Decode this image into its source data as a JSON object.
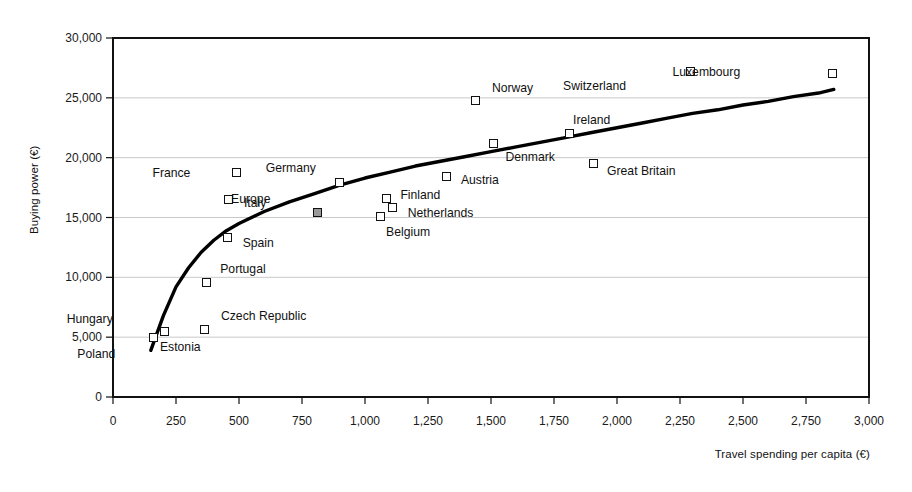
{
  "chart_data": {
    "type": "scatter",
    "title": "",
    "xlabel": "Travel spending per capita (€)",
    "ylabel": "Buying power (€)",
    "xlim": [
      0,
      3000
    ],
    "ylim": [
      0,
      30000
    ],
    "xticks": [
      "0",
      "250",
      "500",
      "750",
      "1,000",
      "1,250",
      "1,500",
      "1,750",
      "2,000",
      "2,250",
      "2,500",
      "2,750",
      "3,000"
    ],
    "xtick_values": [
      0,
      250,
      500,
      750,
      1000,
      1250,
      1500,
      1750,
      2000,
      2250,
      2500,
      2750,
      3000
    ],
    "yticks": [
      "0",
      "5,000",
      "10,000",
      "15,000",
      "20,000",
      "25,000",
      "30,000"
    ],
    "ytick_values": [
      0,
      5000,
      10000,
      15000,
      20000,
      25000,
      30000
    ],
    "grid": "horizontal",
    "legend": "none",
    "points": [
      {
        "label": "Poland",
        "x": 160,
        "y": 5000,
        "label_dx": -44,
        "label_dy": 17,
        "highlight": false
      },
      {
        "label": "Hungary",
        "x": 205,
        "y": 5500,
        "label_dx": -58,
        "label_dy": -12,
        "highlight": false
      },
      {
        "label": "Estonia",
        "x": 365,
        "y": 5600,
        "label_dx": -10,
        "label_dy": 17,
        "highlight": false
      },
      {
        "label": "Czech Republic",
        "x": 365,
        "y": 5600,
        "label_dx": 16,
        "label_dy": -14,
        "highlight": false
      },
      {
        "label": "Portugal",
        "x": 370,
        "y": 9600,
        "label_dx": 14,
        "label_dy": -13,
        "highlight": false
      },
      {
        "label": "Spain",
        "x": 455,
        "y": 13300,
        "label_dx": 15,
        "label_dy": 5,
        "highlight": false
      },
      {
        "label": "Italy",
        "x": 460,
        "y": 16500,
        "label_dx": 15,
        "label_dy": 3,
        "highlight": false
      },
      {
        "label": "France",
        "x": 490,
        "y": 18800,
        "label_dx": -52,
        "label_dy": 1,
        "highlight": false
      },
      {
        "label": "Europe",
        "x": 810,
        "y": 15400,
        "label_dx": -53,
        "label_dy": -14,
        "highlight": true
      },
      {
        "label": "Germany",
        "x": 900,
        "y": 17900,
        "label_dx": -30,
        "label_dy": -15,
        "highlight": false
      },
      {
        "label": "Belgium",
        "x": 1060,
        "y": 15100,
        "label_dx": 6,
        "label_dy": 16,
        "highlight": false
      },
      {
        "label": "Finland",
        "x": 1085,
        "y": 16600,
        "label_dx": 14,
        "label_dy": -3,
        "highlight": false
      },
      {
        "label": "Netherlands",
        "x": 1110,
        "y": 15800,
        "label_dx": 15,
        "label_dy": 5,
        "highlight": false
      },
      {
        "label": "Austria",
        "x": 1325,
        "y": 18400,
        "label_dx": 14,
        "label_dy": 3,
        "highlight": false
      },
      {
        "label": "Norway",
        "x": 1440,
        "y": 24800,
        "label_dx": 16,
        "label_dy": -12,
        "highlight": false
      },
      {
        "label": "Denmark",
        "x": 1510,
        "y": 21200,
        "label_dx": 12,
        "label_dy": 14,
        "highlight": false
      },
      {
        "label": "Ireland",
        "x": 1810,
        "y": 22000,
        "label_dx": 4,
        "label_dy": -14,
        "highlight": false
      },
      {
        "label": "Great Britain",
        "x": 1905,
        "y": 19500,
        "label_dx": 14,
        "label_dy": 7,
        "highlight": false
      },
      {
        "label": "Switzerland",
        "x": 2290,
        "y": 27200,
        "label_dx": -70,
        "label_dy": 14,
        "highlight": false
      },
      {
        "label": "Luxembourg",
        "x": 2855,
        "y": 27000,
        "label_dx": -98,
        "label_dy": -2,
        "highlight": false
      }
    ],
    "trend": {
      "description": "logarithmic fit curve",
      "points": [
        [
          150,
          3900
        ],
        [
          200,
          6800
        ],
        [
          250,
          9200
        ],
        [
          300,
          10800
        ],
        [
          350,
          12100
        ],
        [
          400,
          13100
        ],
        [
          450,
          13900
        ],
        [
          500,
          14500
        ],
        [
          600,
          15500
        ],
        [
          700,
          16300
        ],
        [
          800,
          17000
        ],
        [
          900,
          17700
        ],
        [
          1000,
          18300
        ],
        [
          1100,
          18800
        ],
        [
          1200,
          19300
        ],
        [
          1300,
          19700
        ],
        [
          1400,
          20100
        ],
        [
          1500,
          20500
        ],
        [
          1600,
          20900
        ],
        [
          1700,
          21300
        ],
        [
          1800,
          21700
        ],
        [
          1900,
          22100
        ],
        [
          2000,
          22500
        ],
        [
          2100,
          22900
        ],
        [
          2200,
          23300
        ],
        [
          2300,
          23700
        ],
        [
          2400,
          24000
        ],
        [
          2500,
          24400
        ],
        [
          2600,
          24700
        ],
        [
          2700,
          25100
        ],
        [
          2800,
          25400
        ],
        [
          2860,
          25700
        ]
      ]
    },
    "colors": {
      "marker_edge": "#111111",
      "marker_fill": "#ffffff",
      "highlight_fill": "#9a9a9a",
      "trend_line": "#000000",
      "gridline": "#c9c9c9",
      "axis": "#111111"
    }
  },
  "plot_geometry": {
    "left": 113,
    "right": 869,
    "top": 38,
    "bottom": 397
  }
}
